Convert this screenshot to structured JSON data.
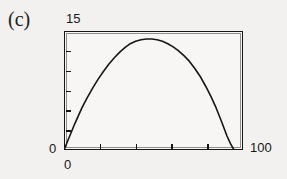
{
  "figure": {
    "panel_label": "(c)",
    "background_color": "#f2f1ef",
    "ink_color": "#161616"
  },
  "axis_labels": {
    "y_max": "15",
    "y_min": "0",
    "x_min": "0",
    "x_max": "100"
  },
  "chart_data": {
    "type": "line",
    "title": "(c)",
    "xlabel": "",
    "ylabel": "",
    "xlim": [
      0,
      100
    ],
    "ylim": [
      0,
      15
    ],
    "grid": false,
    "legend": null,
    "x_ticks_visible": [
      0,
      100
    ],
    "y_ticks_visible": [
      0,
      15
    ],
    "x_minor_tick_count": 4,
    "y_minor_tick_count": 5,
    "series": [
      {
        "name": "curve",
        "x": [
          0,
          2,
          4,
          6,
          8,
          10,
          13,
          16,
          19,
          22,
          25,
          28,
          31,
          34,
          37,
          40,
          43,
          46,
          49,
          52,
          55,
          58,
          61,
          64,
          67,
          70,
          73,
          76,
          79,
          82,
          85,
          88,
          91,
          93,
          95
        ],
        "y": [
          0.0,
          1.1,
          2.2,
          3.3,
          4.3,
          5.3,
          6.6,
          7.8,
          8.9,
          9.9,
          10.8,
          11.6,
          12.3,
          12.9,
          13.4,
          13.7,
          13.9,
          14.0,
          14.0,
          13.9,
          13.7,
          13.4,
          13.0,
          12.5,
          11.9,
          11.2,
          10.3,
          9.3,
          8.1,
          6.8,
          5.3,
          3.6,
          1.8,
          0.8,
          0.0
        ]
      }
    ],
    "peak": {
      "x": 48,
      "y": 14.0
    },
    "zero_crossings": [
      0,
      95
    ]
  }
}
